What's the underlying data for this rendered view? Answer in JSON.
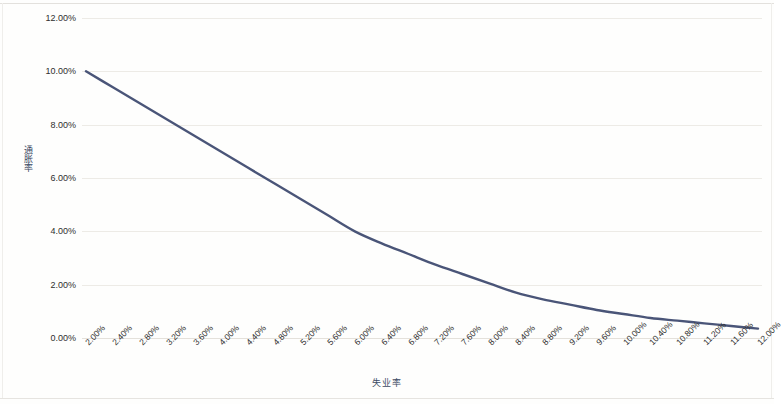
{
  "chart_data": {
    "type": "line",
    "title": "",
    "xlabel": "失业率",
    "ylabel": "通胀率",
    "xlim": [
      2.0,
      12.0
    ],
    "ylim": [
      0.0,
      12.0
    ],
    "grid": true,
    "legend": "none",
    "line_color": "#4a5578",
    "categories": [
      "2.00%",
      "2.40%",
      "2.80%",
      "3.20%",
      "3.60%",
      "4.00%",
      "4.40%",
      "4.80%",
      "5.20%",
      "5.60%",
      "6.00%",
      "6.40%",
      "6.80%",
      "7.20%",
      "7.60%",
      "8.00%",
      "8.40%",
      "8.80%",
      "9.20%",
      "9.60%",
      "10.00%",
      "10.40%",
      "10.80%",
      "11.20%",
      "11.60%",
      "12.00%"
    ],
    "x_values": [
      2.0,
      2.4,
      2.8,
      3.2,
      3.6,
      4.0,
      4.4,
      4.8,
      5.2,
      5.6,
      6.0,
      6.4,
      6.8,
      7.2,
      7.6,
      8.0,
      8.4,
      8.8,
      9.2,
      9.6,
      10.0,
      10.4,
      10.8,
      11.2,
      11.6,
      12.0
    ],
    "values": [
      10.0,
      9.4,
      8.8,
      8.2,
      7.6,
      7.0,
      6.4,
      5.8,
      5.2,
      4.6,
      4.0,
      3.55,
      3.15,
      2.75,
      2.4,
      2.05,
      1.7,
      1.45,
      1.25,
      1.05,
      0.9,
      0.75,
      0.65,
      0.55,
      0.45,
      0.35
    ],
    "y_ticks": [
      "0.00%",
      "2.00%",
      "4.00%",
      "6.00%",
      "8.00%",
      "10.00%",
      "12.00%"
    ],
    "y_tick_values": [
      0,
      2,
      4,
      6,
      8,
      10,
      12
    ],
    "series": [
      {
        "name": "通胀率",
        "values": [
          10.0,
          9.4,
          8.8,
          8.2,
          7.6,
          7.0,
          6.4,
          5.8,
          5.2,
          4.6,
          4.0,
          3.55,
          3.15,
          2.75,
          2.4,
          2.05,
          1.7,
          1.45,
          1.25,
          1.05,
          0.9,
          0.75,
          0.65,
          0.55,
          0.45,
          0.35
        ]
      }
    ]
  }
}
